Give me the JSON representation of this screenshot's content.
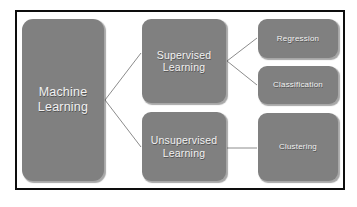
{
  "diagram": {
    "background_color": "#ffffff",
    "frame_color": "#0d0d0d",
    "node_fill_color": "#808080",
    "node_text_color": "#f2f2f2",
    "connector_color": "#8c8c8c",
    "nodes": [
      {
        "id": "machine-learning",
        "label": "Machine\nLearning"
      },
      {
        "id": "supervised",
        "label": "Supervised\nLearning"
      },
      {
        "id": "unsupervised",
        "label": "Unsupervised\nLearning"
      },
      {
        "id": "regression",
        "label": "Regression"
      },
      {
        "id": "classification",
        "label": "Classification"
      },
      {
        "id": "clustering",
        "label": "Clustering"
      }
    ],
    "edges": [
      {
        "from": "machine-learning",
        "to": "supervised"
      },
      {
        "from": "machine-learning",
        "to": "unsupervised"
      },
      {
        "from": "supervised",
        "to": "regression"
      },
      {
        "from": "supervised",
        "to": "classification"
      },
      {
        "from": "unsupervised",
        "to": "clustering"
      }
    ]
  }
}
